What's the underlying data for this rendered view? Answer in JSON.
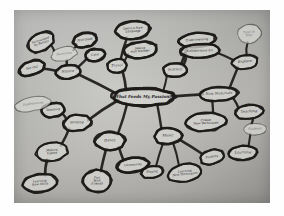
{
  "image": {
    "kind": "photograph-of-handdrawn-mindmap",
    "medium": "black marker on gray paper",
    "paper_color": "#c2c1be",
    "ink_color": "#1b1917",
    "border_color": "#ffffff"
  },
  "mindmap": {
    "center": {
      "label": "What Feeds My Passion?",
      "cx": 143,
      "cy": 97,
      "rx": 31,
      "ry": 9
    },
    "nodes": [
      {
        "id": "nature",
        "label": "Nature",
        "cx": 68,
        "cy": 72,
        "rx": 12,
        "ry": 7,
        "size": "n",
        "rot": -8
      },
      {
        "id": "nurturing",
        "label": "Nurturing",
        "cx": 64,
        "cy": 54,
        "rx": 13,
        "ry": 7,
        "size": "n2",
        "rot": -12,
        "faint": true
      },
      {
        "id": "surrounded",
        "label": "Surrounded\nby Beauty",
        "cx": 41,
        "cy": 42,
        "rx": 14,
        "ry": 9,
        "size": "n2",
        "rot": -30
      },
      {
        "id": "feelgood",
        "label": "Feel Good",
        "cx": 85,
        "cy": 40,
        "rx": 12,
        "ry": 7,
        "size": "n2",
        "rot": -12
      },
      {
        "id": "calm",
        "label": "Calm",
        "cx": 95,
        "cy": 55,
        "rx": 10,
        "ry": 6,
        "size": "n2",
        "rot": -8
      },
      {
        "id": "getout",
        "label": "Get Out",
        "cx": 32,
        "cy": 68,
        "rx": 13,
        "ry": 7,
        "size": "n2",
        "rot": -18
      },
      {
        "id": "travel",
        "label": "Travel",
        "cx": 117,
        "cy": 66,
        "rx": 10,
        "ry": 7,
        "size": "n",
        "rot": -4
      },
      {
        "id": "language",
        "label": "Learn a New\nLanguage",
        "cx": 133,
        "cy": 30,
        "rx": 17,
        "ry": 9,
        "size": "n2",
        "rot": -5
      },
      {
        "id": "wonder",
        "label": "Seeing\nwith Wonder",
        "cx": 140,
        "cy": 50,
        "rx": 17,
        "ry": 8,
        "size": "n2",
        "rot": -6
      },
      {
        "id": "science",
        "label": "Science",
        "cx": 175,
        "cy": 70,
        "rx": 12,
        "ry": 7,
        "size": "n",
        "rot": -3
      },
      {
        "id": "experimenting",
        "label": "Experimenting",
        "cx": 197,
        "cy": 40,
        "rx": 19,
        "ry": 7,
        "size": "n2",
        "rot": -6
      },
      {
        "id": "collabart",
        "label": "Collaborative Art",
        "cx": 200,
        "cy": 51,
        "rx": 20,
        "ry": 7,
        "size": "n2",
        "rot": -3
      },
      {
        "id": "timetoplay",
        "label": "Time to\nPlay",
        "cx": 249,
        "cy": 34,
        "rx": 12,
        "ry": 9,
        "size": "n2",
        "rot": -10,
        "faint": true
      },
      {
        "id": "explore",
        "label": "Explore",
        "cx": 245,
        "cy": 62,
        "rx": 13,
        "ry": 7,
        "size": "n",
        "rot": -6
      },
      {
        "id": "newmaterials",
        "label": "New Materials",
        "cx": 219,
        "cy": 94,
        "rx": 19,
        "ry": 7,
        "size": "n",
        "rot": -4
      },
      {
        "id": "createtech",
        "label": "Create\nNew Techniques",
        "cx": 206,
        "cy": 122,
        "rx": 20,
        "ry": 9,
        "size": "n2",
        "rot": -4
      },
      {
        "id": "teaching",
        "label": "Teaching",
        "cx": 249,
        "cy": 112,
        "rx": 14,
        "ry": 7,
        "size": "n",
        "rot": -6
      },
      {
        "id": "students",
        "label": "Students",
        "cx": 255,
        "cy": 129,
        "rx": 12,
        "ry": 6,
        "size": "n2",
        "rot": -4,
        "faint": true
      },
      {
        "id": "learning",
        "label": "Learning",
        "cx": 243,
        "cy": 153,
        "rx": 14,
        "ry": 7,
        "size": "n",
        "rot": -3
      },
      {
        "id": "music",
        "label": "Music",
        "cx": 168,
        "cy": 136,
        "rx": 14,
        "ry": 8,
        "size": "n",
        "rot": -2
      },
      {
        "id": "playing",
        "label": "Playing",
        "cx": 152,
        "cy": 172,
        "rx": 11,
        "ry": 6,
        "size": "n2",
        "rot": -8
      },
      {
        "id": "learntech",
        "label": "Learning\nNew Techniques",
        "cx": 185,
        "cy": 173,
        "rx": 17,
        "ry": 9,
        "size": "n2",
        "rot": -10
      },
      {
        "id": "painting",
        "label": "Painting",
        "cx": 212,
        "cy": 157,
        "rx": 12,
        "ry": 7,
        "size": "n2",
        "rot": -16
      },
      {
        "id": "dance",
        "label": "Dance",
        "cx": 110,
        "cy": 141,
        "rx": 15,
        "ry": 9,
        "size": "n",
        "rot": -2
      },
      {
        "id": "funfriends",
        "label": "Fun\nWith\nFriends",
        "cx": 97,
        "cy": 181,
        "rx": 14,
        "ry": 11,
        "size": "n2",
        "rot": -4
      },
      {
        "id": "community",
        "label": "Community",
        "cx": 133,
        "cy": 165,
        "rx": 16,
        "ry": 7,
        "size": "n2",
        "rot": -8
      },
      {
        "id": "writing",
        "label": "Writing",
        "cx": 77,
        "cy": 123,
        "rx": 14,
        "ry": 8,
        "size": "n",
        "rot": -6
      },
      {
        "id": "teachingL",
        "label": "Teaching",
        "cx": 53,
        "cy": 110,
        "rx": 12,
        "ry": 7,
        "size": "n2",
        "rot": -8
      },
      {
        "id": "daydreaming",
        "label": "Daydreaming",
        "cx": 33,
        "cy": 104,
        "rx": 18,
        "ry": 7,
        "size": "n2",
        "rot": -12,
        "faint": true
      },
      {
        "id": "makingvideos",
        "label": "Making\nVideos",
        "cx": 52,
        "cy": 152,
        "rx": 16,
        "ry": 9,
        "size": "n2",
        "rot": -8
      },
      {
        "id": "newskills",
        "label": "Learning\nNew Skills",
        "cx": 40,
        "cy": 183,
        "rx": 17,
        "ry": 9,
        "size": "n2",
        "rot": -8
      }
    ],
    "edges": [
      {
        "from": "center",
        "to": "nature"
      },
      {
        "from": "nature",
        "to": "nurturing"
      },
      {
        "from": "nurturing",
        "to": "surrounded"
      },
      {
        "from": "nurturing",
        "to": "feelgood"
      },
      {
        "from": "nature",
        "to": "calm"
      },
      {
        "from": "nature",
        "to": "getout"
      },
      {
        "from": "center",
        "to": "travel"
      },
      {
        "from": "travel",
        "to": "language"
      },
      {
        "from": "travel",
        "to": "wonder"
      },
      {
        "from": "center",
        "to": "science"
      },
      {
        "from": "science",
        "to": "experimenting"
      },
      {
        "from": "science",
        "to": "collabart"
      },
      {
        "from": "explore",
        "to": "timetoplay"
      },
      {
        "from": "collabart",
        "to": "explore"
      },
      {
        "from": "center",
        "to": "newmaterials"
      },
      {
        "from": "newmaterials",
        "to": "explore"
      },
      {
        "from": "newmaterials",
        "to": "createtech"
      },
      {
        "from": "newmaterials",
        "to": "teaching"
      },
      {
        "from": "teaching",
        "to": "students"
      },
      {
        "from": "students",
        "to": "learning"
      },
      {
        "from": "center",
        "to": "music"
      },
      {
        "from": "music",
        "to": "playing"
      },
      {
        "from": "music",
        "to": "learntech"
      },
      {
        "from": "music",
        "to": "painting"
      },
      {
        "from": "center",
        "to": "dance"
      },
      {
        "from": "dance",
        "to": "funfriends"
      },
      {
        "from": "dance",
        "to": "community"
      },
      {
        "from": "center",
        "to": "writing"
      },
      {
        "from": "writing",
        "to": "teachingL"
      },
      {
        "from": "teachingL",
        "to": "daydreaming"
      },
      {
        "from": "writing",
        "to": "makingvideos"
      },
      {
        "from": "makingvideos",
        "to": "newskills"
      }
    ]
  }
}
